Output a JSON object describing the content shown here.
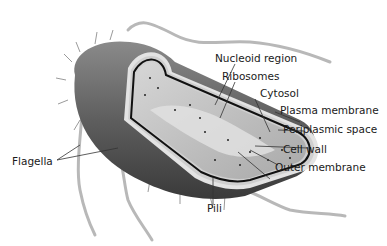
{
  "diagram": {
    "labels": {
      "nucleoid": "Nucleoid region",
      "ribosomes": "Ribosomes",
      "cytosol": "Cytosol",
      "plasma_membrane": "Plasma membrane",
      "periplasmic_space": "Periplasmic space",
      "cell_wall": "Cell wall",
      "outer_membrane": "Outer membrane",
      "flagella": "Flagella",
      "pili": "Pili"
    },
    "colors": {
      "body": "#6b6b6b",
      "body_dark": "#3e3e3e",
      "cytosol": "#c9c9c9",
      "membrane": "#111111",
      "flagellum": "#b5b5b5",
      "leader": "#333333"
    }
  }
}
